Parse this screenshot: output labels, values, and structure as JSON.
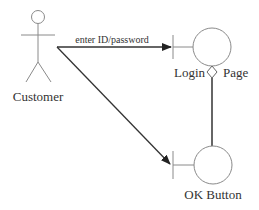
{
  "diagram": {
    "type": "uml-sequence-robustness",
    "actor": {
      "label": "Customer"
    },
    "boundaries": [
      {
        "id": "login",
        "label_left": "Login",
        "label_right": "Page"
      },
      {
        "id": "ok",
        "label": "OK Button"
      }
    ],
    "messages": [
      {
        "from": "Customer",
        "to": "login",
        "label": "enter ID/password"
      },
      {
        "from": "Customer",
        "to": "ok",
        "label": ""
      }
    ],
    "associations": [
      {
        "from": "login",
        "to": "ok",
        "kind": "aggregation"
      }
    ],
    "colors": {
      "stroke": "#8a8a8a",
      "arrow": "#333333",
      "text": "#333333"
    }
  }
}
